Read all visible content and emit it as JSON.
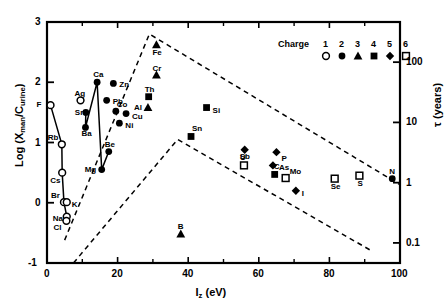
{
  "chart_data": {
    "type": "scatter",
    "title": "",
    "xlabel": "I_z (eV)",
    "ylabel": "Log (X_man/C_urine)",
    "y2label": "τ (years)",
    "xlim": [
      0,
      100
    ],
    "ylim": [
      -1,
      3
    ],
    "y2lim": [
      0.0464,
      464
    ],
    "y2_scale": "log",
    "grid": false,
    "xticks": [
      0,
      20,
      40,
      60,
      80,
      100
    ],
    "xticklabels": [
      "0",
      "20",
      "40",
      "60",
      "80",
      "100"
    ],
    "xminorticks": [
      10,
      30,
      50,
      70,
      90
    ],
    "yticks": [
      -1,
      0,
      1,
      2,
      3
    ],
    "yticklabels": [
      "-1",
      "0",
      "1",
      "2",
      "3"
    ],
    "y2ticks": [
      0.1,
      1,
      10,
      100
    ],
    "y2ticklabels": [
      "0.1",
      "1",
      "10",
      "100"
    ],
    "legend": {
      "title": "Charge",
      "position": "top-right",
      "entries": [
        {
          "charge": "1",
          "symbol": "open-circle"
        },
        {
          "charge": "2",
          "symbol": "filled-circle"
        },
        {
          "charge": "3",
          "symbol": "filled-triangle"
        },
        {
          "charge": "4",
          "symbol": "filled-square"
        },
        {
          "charge": "5",
          "symbol": "filled-diamond"
        },
        {
          "charge": "6",
          "symbol": "open-square"
        }
      ]
    },
    "points": [
      {
        "label": "F",
        "x": 1.0,
        "y": 1.62,
        "symbol": "open-circle",
        "lx": -14,
        "ly": -4
      },
      {
        "label": "Rb",
        "x": 4.2,
        "y": 0.97,
        "symbol": "open-circle",
        "lx": -14,
        "ly": -10
      },
      {
        "label": "Cs",
        "x": 4.3,
        "y": 0.5,
        "symbol": "open-circle",
        "lx": -12,
        "ly": 4
      },
      {
        "label": "Br",
        "x": 4.8,
        "y": 0.01,
        "symbol": "open-circle",
        "lx": -13,
        "ly": -10
      },
      {
        "label": "K",
        "x": 5.6,
        "y": 0.01,
        "symbol": "open-circle",
        "lx": 5,
        "ly": -1
      },
      {
        "label": "Na",
        "x": 5.6,
        "y": -0.23,
        "symbol": "open-circle",
        "lx": -14,
        "ly": -2
      },
      {
        "label": "Cl",
        "x": 5.5,
        "y": -0.3,
        "symbol": "open-circle",
        "lx": -13,
        "ly": 3
      },
      {
        "label": "Ag",
        "x": 9.5,
        "y": 1.7,
        "symbol": "open-circle",
        "lx": -6,
        "ly": -10
      },
      {
        "label": "Sr",
        "x": 11.0,
        "y": 1.5,
        "symbol": "filled-circle",
        "lx": -11,
        "ly": -3
      },
      {
        "label": "Ba",
        "x": 10.9,
        "y": 1.25,
        "symbol": "filled-circle",
        "lx": -4,
        "ly": 3
      },
      {
        "label": "Ca",
        "x": 14.2,
        "y": 2.0,
        "symbol": "filled-circle",
        "lx": -4,
        "ly": -11
      },
      {
        "label": "Mg",
        "x": 15.5,
        "y": 0.55,
        "symbol": "filled-circle",
        "lx": -17,
        "ly": -4
      },
      {
        "label": "Be",
        "x": 17.5,
        "y": 0.85,
        "symbol": "filled-circle",
        "lx": -4,
        "ly": -11
      },
      {
        "label": "Zn",
        "x": 18.8,
        "y": 1.98,
        "symbol": "filled-circle",
        "lx": 6,
        "ly": -2
      },
      {
        "label": "Pb",
        "x": 16.9,
        "y": 1.7,
        "symbol": "filled-circle",
        "lx": 6,
        "ly": -2
      },
      {
        "label": "Co",
        "x": 19.5,
        "y": 1.52,
        "symbol": "filled-circle",
        "lx": 1,
        "ly": -10
      },
      {
        "label": "Cu",
        "x": 22.4,
        "y": 1.48,
        "symbol": "filled-circle",
        "lx": 6,
        "ly": -1
      },
      {
        "label": "Ni",
        "x": 20.5,
        "y": 1.32,
        "symbol": "filled-circle",
        "lx": 6,
        "ly": -1
      },
      {
        "label": "Fe",
        "x": 31.0,
        "y": 2.62,
        "symbol": "filled-triangle",
        "lx": -4,
        "ly": 4
      },
      {
        "label": "Cr",
        "x": 31.0,
        "y": 2.12,
        "symbol": "filled-triangle",
        "lx": -4,
        "ly": -10
      },
      {
        "label": "Th",
        "x": 28.8,
        "y": 1.76,
        "symbol": "filled-square",
        "lx": -4,
        "ly": -11
      },
      {
        "label": "Al",
        "x": 28.6,
        "y": 1.58,
        "symbol": "filled-triangle",
        "lx": -14,
        "ly": -4
      },
      {
        "label": "Si",
        "x": 45.2,
        "y": 1.58,
        "symbol": "filled-square",
        "lx": 6,
        "ly": -1
      },
      {
        "label": "Sn",
        "x": 40.8,
        "y": 1.1,
        "symbol": "filled-square",
        "lx": 1,
        "ly": -11
      },
      {
        "label": "B",
        "x": 37.9,
        "y": -0.52,
        "symbol": "filled-triangle",
        "lx": -3,
        "ly": -11
      },
      {
        "label": "Sb",
        "x": 56.0,
        "y": 0.88,
        "symbol": "filled-diamond",
        "lx": -5,
        "ly": 3
      },
      {
        "label": "P",
        "x": 65.0,
        "y": 0.84,
        "symbol": "filled-diamond",
        "lx": 5,
        "ly": 3
      },
      {
        "label": "U",
        "x": 55.8,
        "y": 0.62,
        "symbol": "open-square",
        "lx": -4,
        "ly": -11
      },
      {
        "label": "As",
        "x": 64.0,
        "y": 0.62,
        "symbol": "filled-diamond",
        "lx": 6,
        "ly": -1
      },
      {
        "label": "C",
        "x": 64.5,
        "y": 0.47,
        "symbol": "filled-square",
        "lx": -1,
        "ly": -11
      },
      {
        "label": "Mo",
        "x": 67.6,
        "y": 0.41,
        "symbol": "open-square",
        "lx": 4,
        "ly": -10
      },
      {
        "label": "Se",
        "x": 81.5,
        "y": 0.4,
        "symbol": "open-square",
        "lx": -4,
        "ly": 4
      },
      {
        "label": "S",
        "x": 88.5,
        "y": 0.45,
        "symbol": "open-square",
        "lx": -2,
        "ly": 4
      },
      {
        "label": "N",
        "x": 97.8,
        "y": 0.4,
        "symbol": "filled-circle",
        "lx": -3,
        "ly": -11
      },
      {
        "label": "I",
        "x": 70.5,
        "y": 0.2,
        "symbol": "filled-diamond",
        "lx": 6,
        "ly": -1
      }
    ],
    "envelope_upper": [
      [
        5.0,
        -0.62
      ],
      [
        29.0,
        2.8
      ],
      [
        100.0,
        0.3
      ]
    ],
    "envelope_lower": [
      [
        7.5,
        -1.0
      ],
      [
        37.0,
        1.05
      ],
      [
        92.0,
        -0.8
      ]
    ],
    "solid_path": [
      [
        1.0,
        1.62
      ],
      [
        4.2,
        0.97
      ],
      [
        4.3,
        0.5
      ],
      [
        4.8,
        0.01
      ],
      [
        5.6,
        -0.23
      ]
    ],
    "solid_path2": [
      [
        11.0,
        1.5
      ],
      [
        10.9,
        1.25
      ],
      [
        14.2,
        2.0
      ],
      [
        15.5,
        0.55
      ],
      [
        17.5,
        0.85
      ]
    ]
  }
}
